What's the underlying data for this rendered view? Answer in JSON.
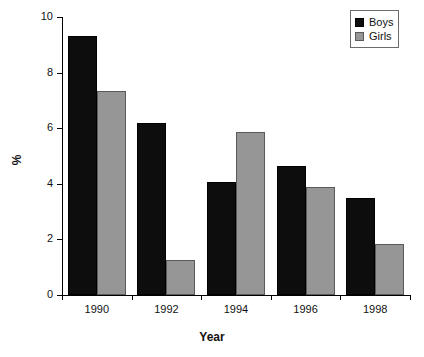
{
  "chart_data": {
    "type": "bar",
    "title": "",
    "xlabel": "Year",
    "ylabel": "%",
    "categories": [
      "1990",
      "1992",
      "1994",
      "1996",
      "1998"
    ],
    "series": [
      {
        "name": "Boys",
        "color": "#0d0d0d",
        "values": [
          9.3,
          6.2,
          4.05,
          4.65,
          3.5
        ]
      },
      {
        "name": "Girls",
        "color": "#969696",
        "values": [
          7.35,
          1.25,
          5.85,
          3.9,
          1.85
        ]
      }
    ],
    "ylim": [
      0,
      10
    ],
    "yticks": [
      "0",
      "2",
      "4",
      "6",
      "8",
      "10"
    ],
    "ytick_values": [
      0,
      2,
      4,
      6,
      8,
      10
    ],
    "grid": false,
    "legend_position": "top-right"
  },
  "legend": {
    "items": [
      {
        "label": "Boys",
        "swatch": "black-square-swatch"
      },
      {
        "label": "Girls",
        "swatch": "gray-square-swatch"
      }
    ]
  },
  "axes": {
    "y_label": "%",
    "x_label": "Year"
  }
}
